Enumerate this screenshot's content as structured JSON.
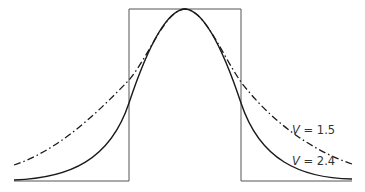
{
  "diagram": {
    "type": "potential-well-with-bell-curves",
    "well": {
      "left_x": 129,
      "right_x": 241,
      "top_y": 9,
      "bottom_y": 181,
      "x_start": 14,
      "x_end": 352
    },
    "curves": [
      {
        "name": "V = 1.5",
        "variable": "V",
        "value": "1.5",
        "style": "dash-dot",
        "label_x": 292,
        "label_y": 134
      },
      {
        "name": "V = 2.4",
        "variable": "V",
        "value": "2.4",
        "style": "solid",
        "label_x": 292,
        "label_y": 165
      }
    ],
    "labels": {
      "curve1_var": "V",
      "curve1_rest": " = 1.5",
      "curve2_var": "V",
      "curve2_rest": " = 2.4"
    },
    "colors": {
      "line": "#1a1a1a",
      "well": "#555555",
      "text": "#333333"
    }
  }
}
